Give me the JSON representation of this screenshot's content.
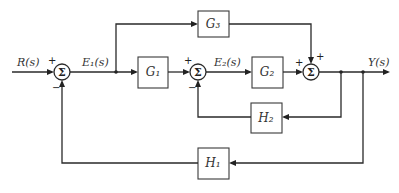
{
  "diagram": {
    "type": "control-system-block-diagram",
    "input": {
      "label": "R(s)"
    },
    "output": {
      "label": "Y(s)"
    },
    "signals": {
      "e1": "E₁(s)",
      "e2": "E₂(s)"
    },
    "summing_symbol": "Σ",
    "blocks": {
      "g1": "G₁",
      "g2": "G₂",
      "g3": "G₃",
      "h1": "H₁",
      "h2": "H₂"
    },
    "summing_junctions": {
      "sum1": {
        "plus": "+",
        "minus": "−"
      },
      "sum2": {
        "plus": "+",
        "minus": "−"
      },
      "sum3": {
        "plus_left": "+",
        "plus_top": "+"
      }
    }
  }
}
